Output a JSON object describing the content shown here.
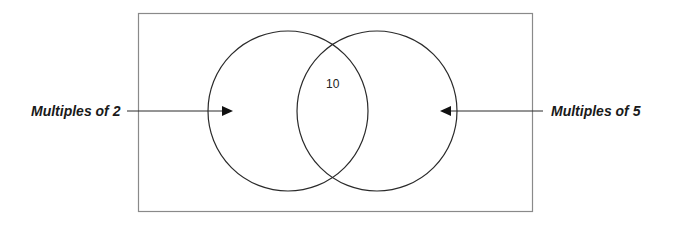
{
  "diagram": {
    "type": "venn",
    "sets": [
      {
        "name": "Multiples of 2",
        "label": "Multiples of 2",
        "side": "left"
      },
      {
        "name": "Multiples of 5",
        "label": "Multiples of 5",
        "side": "right"
      }
    ],
    "intersection": {
      "value": "10"
    },
    "colors": {
      "stroke": "#2a2a2a",
      "frame": "#8a8a8a",
      "text": "#1a1a1a"
    }
  }
}
